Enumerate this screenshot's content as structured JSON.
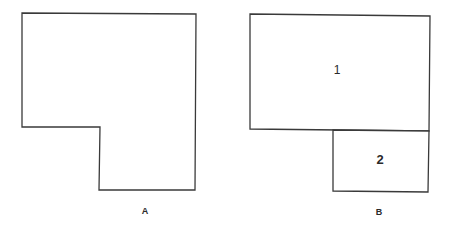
{
  "figures": [
    {
      "id": "A",
      "caption": "A",
      "shape": "L-shaped polygon",
      "regions": []
    },
    {
      "id": "B",
      "caption": "B",
      "shape": "L-shaped polygon divided into two rectangles",
      "regions": [
        {
          "label": "1"
        },
        {
          "label": "2"
        }
      ]
    }
  ],
  "colors": {
    "stroke": "#3a3a3a",
    "background": "#ffffff",
    "text": "#2a2a2a"
  }
}
